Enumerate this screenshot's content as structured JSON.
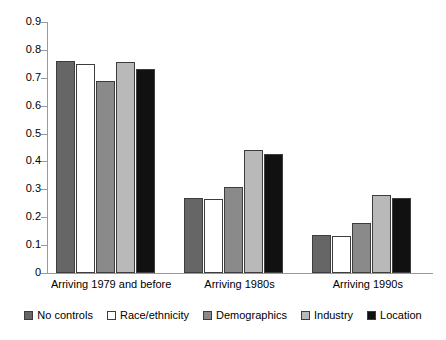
{
  "chart_data": {
    "type": "bar",
    "title": "",
    "subtitle": "",
    "xlabel": "",
    "ylabel": "",
    "ylim": [
      0,
      0.9
    ],
    "yticks": [
      "0",
      "0.1",
      "0.2",
      "0.3",
      "0.4",
      "0.5",
      "0.6",
      "0.7",
      "0.8",
      "0.9"
    ],
    "ytick_values": [
      0,
      0.1,
      0.2,
      0.3,
      0.4,
      0.5,
      0.6,
      0.7,
      0.8,
      0.9
    ],
    "grid": false,
    "legend_position": "bottom",
    "categories": [
      "Arriving 1979 and before",
      "Arriving 1980s",
      "Arriving 1990s"
    ],
    "series": [
      {
        "name": "No controls",
        "color": "#666666",
        "values": [
          0.76,
          0.27,
          0.135
        ]
      },
      {
        "name": "Race/ethnicity",
        "color": "#ffffff",
        "values": [
          0.75,
          0.265,
          0.133
        ]
      },
      {
        "name": "Demographics",
        "color": "#8a8a8a",
        "values": [
          0.69,
          0.31,
          0.18
        ]
      },
      {
        "name": "Industry",
        "color": "#b9b9b9",
        "values": [
          0.755,
          0.44,
          0.28
        ]
      },
      {
        "name": "Location",
        "color": "#111111",
        "values": [
          0.73,
          0.425,
          0.27
        ]
      }
    ]
  },
  "legend": {
    "items": [
      {
        "label": "No controls"
      },
      {
        "label": "Race/ethnicity"
      },
      {
        "label": "Demographics"
      },
      {
        "label": "Industry"
      },
      {
        "label": "Location"
      }
    ]
  }
}
